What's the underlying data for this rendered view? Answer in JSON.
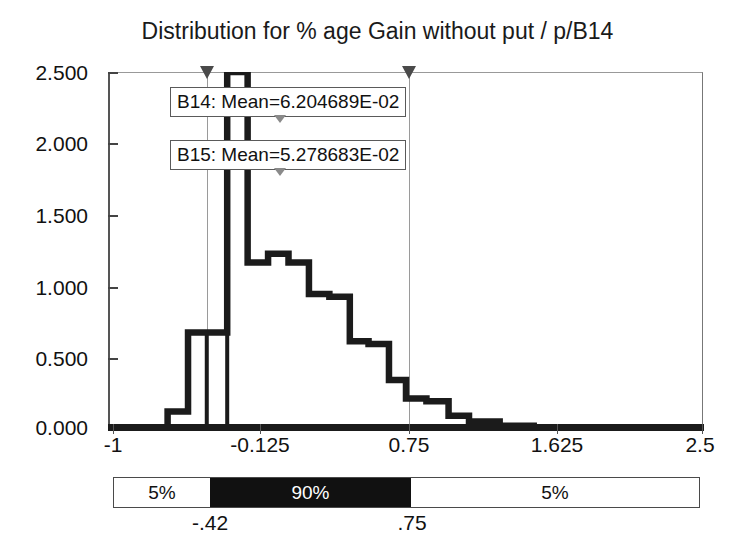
{
  "chart_data": {
    "type": "line",
    "title": "Distribution for % age Gain without put / p/B14",
    "xlabel": "",
    "ylabel": "",
    "xlim": [
      -1,
      2.5
    ],
    "ylim": [
      0,
      2.5
    ],
    "grid": false,
    "legend": "none",
    "x_ticks": [
      "-1",
      "-0.125",
      "0.75",
      "1.625",
      "2.5"
    ],
    "x_tick_values": [
      -1,
      -0.125,
      0.75,
      1.625,
      2.5
    ],
    "y_ticks": [
      "0.000",
      "0.500",
      "1.000",
      "1.500",
      "2.000",
      "2.500"
    ],
    "y_tick_values": [
      0,
      0.5,
      1.0,
      1.5,
      2.0,
      2.5
    ],
    "series": [
      {
        "name": "B14",
        "style": "step-outline",
        "bin_edges": [
          -1.0,
          -0.76,
          -0.65,
          -0.53,
          -0.42,
          -0.3,
          -0.18,
          -0.06,
          0.06,
          0.18,
          0.3,
          0.42,
          0.53,
          0.65,
          0.75,
          0.87,
          1.0,
          1.12,
          1.3,
          1.5,
          1.75,
          2.0,
          2.5
        ],
        "values": [
          0.0,
          0.0,
          0.13,
          0.68,
          0.68,
          2.5,
          1.17,
          1.23,
          1.17,
          0.95,
          0.93,
          0.62,
          0.6,
          0.35,
          0.22,
          0.2,
          0.1,
          0.06,
          0.03,
          0.02,
          0.01,
          0.0
        ]
      },
      {
        "name": "B15",
        "style": "step-outline",
        "bin_edges": [
          -1.0,
          -0.76,
          -0.65,
          -0.53,
          -0.42,
          -0.3,
          -0.18,
          -0.06,
          0.06,
          0.18,
          0.3,
          0.42,
          0.53,
          0.65,
          0.75,
          0.87,
          1.0,
          1.12,
          1.3,
          1.5,
          1.75,
          2.0,
          2.5
        ],
        "values": [
          0.0,
          0.0,
          0.13,
          0.68,
          0.0,
          2.5,
          1.17,
          1.23,
          1.17,
          0.95,
          0.93,
          0.62,
          0.6,
          0.35,
          0.22,
          0.2,
          0.1,
          0.06,
          0.03,
          0.02,
          0.01,
          0.0
        ]
      }
    ],
    "markers": [
      {
        "label": "left-marker",
        "x": -0.42
      },
      {
        "label": "right-marker",
        "x": 0.75
      }
    ],
    "annotations": [
      {
        "name": "b14-mean",
        "text": "B14: Mean=6.204689E-02",
        "value": 0.06204689
      },
      {
        "name": "b15-mean",
        "text": "B15: Mean=5.278683E-02",
        "value": 0.05278683
      }
    ],
    "percentile_bar": {
      "segments": [
        {
          "label": "5%",
          "fill": "light",
          "from": -1.0,
          "to": -0.42
        },
        {
          "label": "90%",
          "fill": "dark",
          "from": -0.42,
          "to": 0.75
        },
        {
          "label": "5%",
          "fill": "light",
          "from": 0.75,
          "to": 2.5
        }
      ],
      "boundaries": [
        {
          "label": "-.42",
          "x": -0.42
        },
        {
          "label": ".75",
          "x": 0.75
        }
      ]
    },
    "colors": {
      "series_line": "#1b1b1b",
      "axis": "#555555",
      "marker": "#4a4a4a",
      "bar_dark": "#111111",
      "background": "#ffffff"
    }
  }
}
